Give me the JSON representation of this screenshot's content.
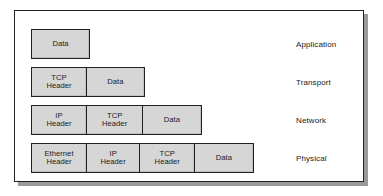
{
  "figure": {
    "box_fill_color": "#d6d6d6",
    "box_border_color": "#231f20",
    "frame_border_color": "#231f20",
    "background_color": "#ffffff"
  },
  "rows": [
    {
      "layer": "Application",
      "segments": [
        {
          "label": "Data"
        }
      ]
    },
    {
      "layer": "Transport",
      "segments": [
        {
          "label": "TCP\nHeader"
        },
        {
          "label": "Data"
        }
      ]
    },
    {
      "layer": "Network",
      "segments": [
        {
          "label": "IP\nHeader"
        },
        {
          "label": "TCP\nHeader"
        },
        {
          "label": "Data"
        }
      ]
    },
    {
      "layer": "Physical",
      "segments": [
        {
          "label": "Ethernet\nHeader"
        },
        {
          "label": "IP\nHeader"
        },
        {
          "label": "TCP\nHeader"
        },
        {
          "label": "Data"
        }
      ]
    }
  ]
}
